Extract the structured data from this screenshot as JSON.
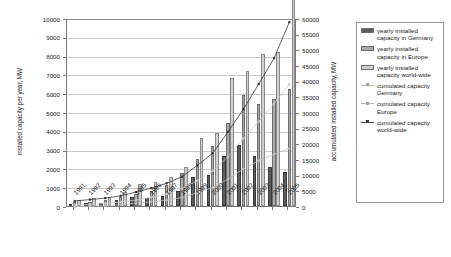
{
  "chart_data": {
    "type": "bar",
    "title": "",
    "xlabel": "",
    "ylabel": "installed capacity per year, MW",
    "ylabel_secondary": "accumulated installed capacity, MW",
    "categories": [
      "1991",
      "1992",
      "1993",
      "1994",
      "1995",
      "1996",
      "1997",
      "1998",
      "1999",
      "2000",
      "2001",
      "2002",
      "2003",
      "2004",
      "2005"
    ],
    "ylim": [
      0,
      10000
    ],
    "yticks": [
      "0",
      "1000",
      "2000",
      "3000",
      "4000",
      "5000",
      "6000",
      "7000",
      "8000",
      "9000",
      "10000"
    ],
    "ylim_secondary": [
      0,
      60000
    ],
    "yticks_secondary": [
      "0",
      "5000",
      "10000",
      "15000",
      "20000",
      "25000",
      "30000",
      "35000",
      "40000",
      "45000",
      "50000",
      "55000",
      "60000"
    ],
    "grid": true,
    "legend_position": "right",
    "series": [
      {
        "name": "yearly installed capacity in Germany",
        "axis": "left",
        "type": "bar",
        "color": "#5d5d5d",
        "values": [
          106,
          174,
          155,
          309,
          505,
          426,
          533,
          793,
          1568,
          1665,
          2659,
          3247,
          2645,
          2054,
          1808
        ]
      },
      {
        "name": "yearly installed capacity in Europe",
        "axis": "left",
        "type": "bar",
        "color": "#a8a8a8",
        "values": [
          215,
          240,
          300,
          470,
          620,
          820,
          1100,
          1750,
          2500,
          3200,
          4400,
          5900,
          5400,
          5700,
          6200
        ]
      },
      {
        "name": "yearly installed capacity world-wide",
        "axis": "left",
        "type": "bar",
        "color": "#cfcfcf",
        "values": [
          340,
          430,
          480,
          730,
          1180,
          1290,
          1530,
          2100,
          3600,
          3900,
          6800,
          7200,
          8100,
          8200,
          11500
        ]
      },
      {
        "name": "cumulated capacity Germany",
        "axis": "right",
        "type": "line",
        "color": "#bdbdbd",
        "values": [
          106,
          280,
          435,
          744,
          1249,
          1675,
          2208,
          3001,
          4569,
          6234,
          8893,
          12140,
          14785,
          16839,
          18647
        ]
      },
      {
        "name": "cumulated capacity Europe",
        "axis": "right",
        "type": "line",
        "color": "#c9c9c9",
        "values": [
          600,
          840,
          1140,
          1610,
          2230,
          3050,
          4150,
          5900,
          8400,
          11600,
          16000,
          21900,
          27300,
          33000,
          39200
        ]
      },
      {
        "name": "cumulated capacity world-wide",
        "axis": "right",
        "type": "line",
        "color": "#3a3a3a",
        "values": [
          1930,
          2360,
          2840,
          3570,
          4750,
          6040,
          7570,
          9670,
          13270,
          17170,
          23970,
          31170,
          39270,
          47470,
          58970
        ]
      }
    ]
  },
  "legend": {
    "entries": [
      {
        "label": "yearly installed capacity in Germany",
        "kind": "swatch",
        "color": "#5d5d5d"
      },
      {
        "label": "yearly installed capacity in Europe",
        "kind": "swatch",
        "color": "#a8a8a8"
      },
      {
        "label": "yearly installed capacity world-wide",
        "kind": "swatch",
        "color": "#cfcfcf"
      },
      {
        "label": "cumulated capacity Germany",
        "kind": "line",
        "color": "#bdbdbd"
      },
      {
        "label": "cumulated capacity Europe",
        "kind": "line",
        "color": "#c9c9c9"
      },
      {
        "label": "cumulated capacity world-wide",
        "kind": "line",
        "color": "#3a3a3a"
      }
    ]
  }
}
